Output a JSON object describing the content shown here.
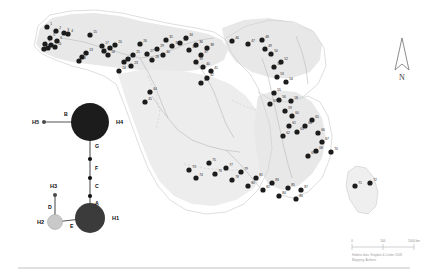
{
  "figure": {
    "background_color": "#ffffff"
  },
  "map": {
    "land_fill": "#fbfbfb",
    "land_stroke": "#d8d8d8",
    "range_fill": "#e8e8e8",
    "range_fill_light": "#efefef",
    "river_stroke": "#b9b9b9",
    "border_stroke": "#cccccc",
    "point_fill": "#1c1c1c",
    "point_radius": 2.6,
    "localities": [
      {
        "id": "1",
        "x": 47,
        "y": 27
      },
      {
        "id": "2",
        "x": 56,
        "y": 31
      },
      {
        "id": "3",
        "x": 64,
        "y": 33
      },
      {
        "id": "4",
        "x": 68,
        "y": 34
      },
      {
        "id": "5",
        "x": 50,
        "y": 38
      },
      {
        "id": "6",
        "x": 57,
        "y": 41
      },
      {
        "id": "7",
        "x": 45,
        "y": 44
      },
      {
        "id": "8",
        "x": 51,
        "y": 45
      },
      {
        "id": "9",
        "x": 48,
        "y": 48
      },
      {
        "id": "10",
        "x": 44,
        "y": 49
      },
      {
        "id": "11",
        "x": 55,
        "y": 47
      },
      {
        "id": "12",
        "x": 82,
        "y": 57
      },
      {
        "id": "13",
        "x": 86,
        "y": 53
      },
      {
        "id": "14",
        "x": 79,
        "y": 61
      },
      {
        "id": "15",
        "x": 90,
        "y": 35
      },
      {
        "id": "16",
        "x": 104,
        "y": 51
      },
      {
        "id": "17",
        "x": 102,
        "y": 46
      },
      {
        "id": "18",
        "x": 108,
        "y": 55
      },
      {
        "id": "19",
        "x": 110,
        "y": 48
      },
      {
        "id": "20",
        "x": 115,
        "y": 45
      },
      {
        "id": "21",
        "x": 128,
        "y": 59
      },
      {
        "id": "22",
        "x": 124,
        "y": 62
      },
      {
        "id": "23",
        "x": 131,
        "y": 66
      },
      {
        "id": "24",
        "x": 119,
        "y": 71
      },
      {
        "id": "25",
        "x": 133,
        "y": 55
      },
      {
        "id": "26",
        "x": 140,
        "y": 44
      },
      {
        "id": "27",
        "x": 147,
        "y": 54
      },
      {
        "id": "28",
        "x": 152,
        "y": 60
      },
      {
        "id": "29",
        "x": 157,
        "y": 49
      },
      {
        "id": "30",
        "x": 163,
        "y": 55
      },
      {
        "id": "31",
        "x": 166,
        "y": 40
      },
      {
        "id": "32",
        "x": 172,
        "y": 46
      },
      {
        "id": "33",
        "x": 180,
        "y": 43
      },
      {
        "id": "34",
        "x": 186,
        "y": 38
      },
      {
        "id": "35",
        "x": 189,
        "y": 50
      },
      {
        "id": "36",
        "x": 196,
        "y": 45
      },
      {
        "id": "37",
        "x": 201,
        "y": 55
      },
      {
        "id": "38",
        "x": 207,
        "y": 48
      },
      {
        "id": "39",
        "x": 196,
        "y": 62
      },
      {
        "id": "40",
        "x": 203,
        "y": 67
      },
      {
        "id": "41",
        "x": 211,
        "y": 71
      },
      {
        "id": "42",
        "x": 207,
        "y": 78
      },
      {
        "id": "43",
        "x": 201,
        "y": 83
      },
      {
        "id": "44",
        "x": 150,
        "y": 92
      },
      {
        "id": "45",
        "x": 145,
        "y": 102
      },
      {
        "id": "46",
        "x": 232,
        "y": 41
      },
      {
        "id": "47",
        "x": 248,
        "y": 44
      },
      {
        "id": "48",
        "x": 262,
        "y": 40
      },
      {
        "id": "49",
        "x": 265,
        "y": 49
      },
      {
        "id": "50",
        "x": 271,
        "y": 54
      },
      {
        "id": "51",
        "x": 274,
        "y": 67
      },
      {
        "id": "52",
        "x": 281,
        "y": 62
      },
      {
        "id": "53",
        "x": 277,
        "y": 77
      },
      {
        "id": "54",
        "x": 286,
        "y": 82
      },
      {
        "id": "55",
        "x": 274,
        "y": 93
      },
      {
        "id": "56",
        "x": 279,
        "y": 100
      },
      {
        "id": "57",
        "x": 270,
        "y": 104
      },
      {
        "id": "58",
        "x": 291,
        "y": 101
      },
      {
        "id": "59",
        "x": 285,
        "y": 111
      },
      {
        "id": "60",
        "x": 292,
        "y": 116
      },
      {
        "id": "61",
        "x": 289,
        "y": 126
      },
      {
        "id": "62",
        "x": 283,
        "y": 136
      },
      {
        "id": "63",
        "x": 297,
        "y": 132
      },
      {
        "id": "64",
        "x": 305,
        "y": 126
      },
      {
        "id": "65",
        "x": 312,
        "y": 120
      },
      {
        "id": "66",
        "x": 318,
        "y": 133
      },
      {
        "id": "67",
        "x": 322,
        "y": 142
      },
      {
        "id": "68",
        "x": 316,
        "y": 151
      },
      {
        "id": "69",
        "x": 308,
        "y": 156
      },
      {
        "id": "70",
        "x": 331,
        "y": 152
      },
      {
        "id": "71",
        "x": 355,
        "y": 186
      },
      {
        "id": "72",
        "x": 370,
        "y": 183
      },
      {
        "id": "73",
        "x": 189,
        "y": 170
      },
      {
        "id": "74",
        "x": 196,
        "y": 178
      },
      {
        "id": "75",
        "x": 209,
        "y": 163
      },
      {
        "id": "76",
        "x": 215,
        "y": 174
      },
      {
        "id": "77",
        "x": 226,
        "y": 168
      },
      {
        "id": "78",
        "x": 232,
        "y": 180
      },
      {
        "id": "79",
        "x": 241,
        "y": 172
      },
      {
        "id": "80",
        "x": 248,
        "y": 186
      },
      {
        "id": "81",
        "x": 256,
        "y": 178
      },
      {
        "id": "82",
        "x": 263,
        "y": 190
      },
      {
        "id": "83",
        "x": 272,
        "y": 183
      },
      {
        "id": "84",
        "x": 279,
        "y": 196
      },
      {
        "id": "85",
        "x": 288,
        "y": 188
      },
      {
        "id": "86",
        "x": 296,
        "y": 199
      },
      {
        "id": "87",
        "x": 301,
        "y": 190
      }
    ]
  },
  "network": {
    "caption": "mtDNA haplotype network",
    "nodes": [
      {
        "id": "H4",
        "label": "H4",
        "x": 90,
        "y": 122,
        "r": 19,
        "fill": "#1c1c1c",
        "label_x": 116,
        "label_y": 124
      },
      {
        "id": "H5",
        "label": "H5",
        "x": 44,
        "y": 122,
        "r": 2.0,
        "fill": "#4a4a4a",
        "label_x": 32,
        "label_y": 124
      },
      {
        "id": "H1",
        "label": "H1",
        "x": 90,
        "y": 218,
        "r": 15,
        "fill": "#3b3b3b",
        "label_x": 112,
        "label_y": 220
      },
      {
        "id": "H2",
        "label": "H2",
        "x": 55,
        "y": 222,
        "r": 7.5,
        "fill": "#c9c9c9",
        "label_x": 37,
        "label_y": 224
      },
      {
        "id": "H3",
        "label": "H3",
        "x": 55,
        "y": 195,
        "r": 2.0,
        "fill": "#4a4a4a",
        "label_x": 50,
        "label_y": 188
      }
    ],
    "median_vectors": [
      {
        "x": 90,
        "y": 159
      },
      {
        "x": 90,
        "y": 178
      },
      {
        "x": 90,
        "y": 196
      }
    ],
    "edges": [
      {
        "label": "B",
        "from": "H5",
        "to": "H4",
        "label_x": 64,
        "label_y": 116
      },
      {
        "label": "G",
        "from": "H4",
        "to": "mv1",
        "label_x": 95,
        "label_y": 148
      },
      {
        "label": "F",
        "from": "mv1",
        "to": "mv2",
        "label_x": 95,
        "label_y": 170
      },
      {
        "label": "C",
        "from": "mv2",
        "to": "mv3",
        "label_x": 95,
        "label_y": 188
      },
      {
        "label": "A",
        "from": "mv3",
        "to": "H1",
        "label_x": 95,
        "label_y": 205
      },
      {
        "label": "D",
        "from": "H3",
        "to": "H2",
        "label_x": 48,
        "label_y": 209
      },
      {
        "label": "E",
        "from": "H2",
        "to": "H1",
        "label_x": 70,
        "label_y": 228
      }
    ],
    "edge_stroke": "#555555"
  },
  "north_arrow": {
    "label": "N",
    "x": 402,
    "y": 60
  },
  "scale_bar": {
    "labels": [
      "0",
      "500",
      "1000 km"
    ],
    "x": 352,
    "y": 243,
    "width": 62,
    "color": "#bdbdbd"
  },
  "credit": {
    "line1": "Habitat data: Kingdon & Linder 2008",
    "line2": "Mapping: Authors"
  },
  "divider": {
    "y": 268,
    "color": "#b0b0b0"
  }
}
